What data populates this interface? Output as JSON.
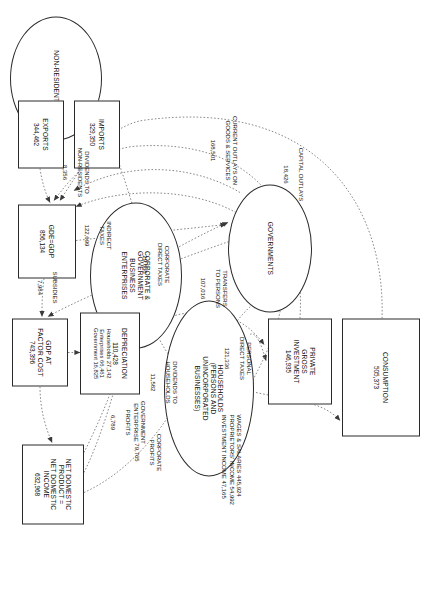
{
  "diagram": {
    "type": "economic-flow-diagram",
    "orientation": "rotated-90-clockwise",
    "currency_note": "values in millions"
  },
  "nodes": [
    {
      "id": "consumption",
      "shape": "box",
      "title": "CONSUMPTION",
      "value": "505,373",
      "x": 318,
      "y": 12,
      "w": 118,
      "h": 78
    },
    {
      "id": "private-gross-investment",
      "shape": "box",
      "title": "PRIVATE\nGROSS\nINVESTMENT",
      "value": "146,935",
      "x": 318,
      "y": 100,
      "w": 86,
      "h": 64
    },
    {
      "id": "households",
      "shape": "ell",
      "title": "HOUSEHOLDS\n(PERSONS AND\nUNINCORPORATED\nBUSINESSES)",
      "value": "",
      "x": 300,
      "y": 178,
      "w": 176,
      "h": 90
    },
    {
      "id": "governments",
      "shape": "ell",
      "title": "GOVERNMENTS",
      "value": "",
      "x": 184,
      "y": 120,
      "w": 128,
      "h": 84
    },
    {
      "id": "corporate-government-business-enterprises",
      "shape": "ell",
      "title": "CORPORATE &\nGOVERNMENT\nBUSINESS\nENTERPRISES",
      "value": "",
      "x": 202,
      "y": 250,
      "w": 146,
      "h": 92
    },
    {
      "id": "non-residents",
      "shape": "ell",
      "title": "NON-RESIDENTS",
      "value": "",
      "x": 16,
      "y": 330,
      "w": 124,
      "h": 92
    },
    {
      "id": "imports",
      "shape": "box",
      "title": "IMPORTS",
      "value": "329,350",
      "x": 100,
      "y": 312,
      "w": 68,
      "h": 46
    },
    {
      "id": "exports",
      "shape": "box",
      "title": "EXPORTS",
      "value": "344,462",
      "x": 100,
      "y": 368,
      "w": 68,
      "h": 46
    },
    {
      "id": "gde-gdp",
      "shape": "box",
      "title": "GDE=GDP",
      "value": "856,134",
      "x": 204,
      "y": 356,
      "w": 74,
      "h": 58
    },
    {
      "id": "gdp-at-factor-cost",
      "shape": "box",
      "title": "GDP AT\nFACTOR COST",
      "value": "743,396",
      "x": 318,
      "y": 364,
      "w": 68,
      "h": 56
    },
    {
      "id": "depreciation",
      "shape": "box",
      "title": "DEPRECIATION",
      "value": "110,428",
      "x": 312,
      "y": 292,
      "w": 82,
      "h": 60,
      "sublines": [
        "Households   27,142",
        "Enterprises   66,461",
        "Government   16,825"
      ]
    },
    {
      "id": "net-domestic-product",
      "shape": "box",
      "title": "NET DOMESTIC\nPRODUCT =\nNET DOMESTIC\nINCOME",
      "value": "632,968",
      "x": 444,
      "y": 348,
      "w": 80,
      "h": 62
    }
  ],
  "depreciation_breakdown": {
    "total": "110,428",
    "households": "27,142",
    "enterprises": "66,461",
    "government": "16,825"
  },
  "flows": [
    {
      "id": "current-outlays",
      "label": "CURRENT OUTLAYS ON\nGOODS & SERVICES",
      "value": "168,501",
      "x": 148,
      "y": 196
    },
    {
      "id": "capital-outlays",
      "label": "CAPITAL OUTLAYS",
      "value": "18,426",
      "x": 172,
      "y": 128
    },
    {
      "id": "transfers-to-persons",
      "label": "TRANSFERS\nTO PERSONS",
      "value": "107,016",
      "x": 286,
      "y": 206
    },
    {
      "id": "personal-direct-taxes",
      "label": "PERSONAL\nDIRECT TAXES",
      "value": "121,336",
      "x": 356,
      "y": 182
    },
    {
      "id": "corporate-direct-taxes",
      "label": "CORPORATE\nDIRECT TAXES",
      "value": "29,688",
      "x": 262,
      "y": 264
    },
    {
      "id": "dividends-to-households",
      "label": "DIVIDENDS TO\nHOUSEHOLDS",
      "value": "11,582",
      "x": 378,
      "y": 256
    },
    {
      "id": "dividends-to-non-residents",
      "label": "DIVIDENDS TO\nNON-RESIDENTS",
      "value": "8,356",
      "x": 170,
      "y": 344
    },
    {
      "id": "indirect-taxes",
      "label": "INDIRECT\nTAXES",
      "value": "122,699",
      "x": 234,
      "y": 322
    },
    {
      "id": "subsidies",
      "label": "SUBSIDIES",
      "value": "7,984",
      "x": 286,
      "y": 374
    },
    {
      "id": "government-enterprise-profits",
      "label": "GOVERNMENT\nENTERPRISE\nPROFITS",
      "value": "6,789",
      "x": 420,
      "y": 292
    },
    {
      "id": "corporate-profits",
      "label": "CORPORATE\nPROFITS",
      "value": "79,765",
      "x": 452,
      "y": 270
    },
    {
      "id": "factor-incomes",
      "label": "WAGES & SALARIES 445,924\nPROPRIETORS' INCOME 54,992\nINVESTMENT INCOME 47,165",
      "value": "",
      "x": 470,
      "y": 192
    }
  ],
  "factor_incomes": {
    "wages_and_salaries": "445,924",
    "proprietors_income": "54,992",
    "investment_income": "47,165"
  },
  "style": {
    "stroke": "#2a2a2a",
    "flow_stroke": "#6a6a6a",
    "background": "#ffffff"
  }
}
